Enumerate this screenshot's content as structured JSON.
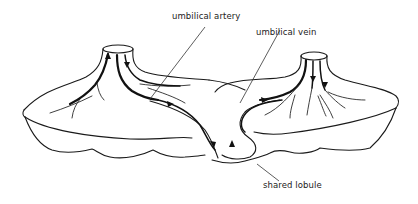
{
  "figure": {
    "type": "anatomical-diagram",
    "labels": {
      "umbilical_artery": "umbilical  artery",
      "umbilical_vein": "umbilical vein",
      "shared_lobule": "shared  lobule"
    },
    "elements": {
      "left_placenta": "left placental disc with cord stump",
      "right_placenta": "right placental disc with cord stump",
      "shared_lobule": "connecting lobule between the two discs"
    },
    "colors": {
      "line": "#1a1a1a",
      "background": "#ffffff"
    }
  }
}
